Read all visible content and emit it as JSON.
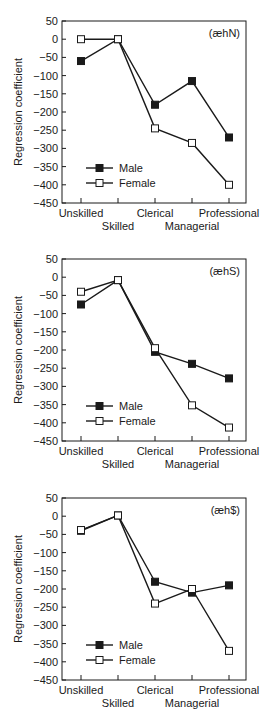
{
  "chart_data": [
    {
      "type": "line",
      "title": "",
      "annotation": "(æhN)",
      "xlabel": "",
      "ylabel": "Regression coefficient",
      "ylim": [
        -450,
        50
      ],
      "yticks": [
        50,
        0,
        -50,
        -100,
        -150,
        -200,
        -250,
        -300,
        -350,
        -400,
        -450
      ],
      "categories": [
        "Unskilled",
        "Skilled",
        "Clerical",
        "Managerial",
        "Professional"
      ],
      "grid": false,
      "legend_position": "lower-left",
      "series": [
        {
          "name": "Male",
          "marker": "filled-square",
          "values": [
            -60,
            0,
            -180,
            -115,
            -270
          ]
        },
        {
          "name": "Female",
          "marker": "open-square",
          "values": [
            0,
            0,
            -245,
            -285,
            -400
          ]
        }
      ]
    },
    {
      "type": "line",
      "title": "",
      "annotation": "(æhS)",
      "xlabel": "",
      "ylabel": "Regression coefficient",
      "ylim": [
        -450,
        50
      ],
      "yticks": [
        50,
        0,
        -50,
        -100,
        -150,
        -200,
        -250,
        -300,
        -350,
        -400,
        -450
      ],
      "categories": [
        "Unskilled",
        "Skilled",
        "Clerical",
        "Managerial",
        "Professional"
      ],
      "grid": false,
      "legend_position": "lower-left",
      "series": [
        {
          "name": "Male",
          "marker": "filled-square",
          "values": [
            -75,
            -8,
            -205,
            -238,
            -278
          ]
        },
        {
          "name": "Female",
          "marker": "open-square",
          "values": [
            -40,
            -8,
            -195,
            -352,
            -413
          ]
        }
      ]
    },
    {
      "type": "line",
      "title": "",
      "annotation": "(æh$)",
      "xlabel": "",
      "ylabel": "Regression coefficient",
      "ylim": [
        -450,
        50
      ],
      "yticks": [
        50,
        0,
        -50,
        -100,
        -150,
        -200,
        -250,
        -300,
        -350,
        -400,
        -450
      ],
      "categories": [
        "Unskilled",
        "Skilled",
        "Clerical",
        "Managerial",
        "Professional"
      ],
      "grid": false,
      "legend_position": "lower-left",
      "series": [
        {
          "name": "Male",
          "marker": "filled-square",
          "values": [
            -40,
            2,
            -180,
            -210,
            -190
          ]
        },
        {
          "name": "Female",
          "marker": "open-square",
          "values": [
            -38,
            2,
            -240,
            -200,
            -370
          ]
        }
      ]
    }
  ],
  "legend": {
    "male": "Male",
    "female": "Female"
  },
  "colors": {
    "line": "#1a1a1a",
    "background": "#ffffff"
  }
}
